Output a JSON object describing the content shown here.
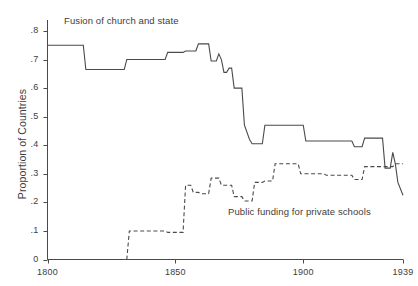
{
  "chart_data": {
    "type": "line",
    "title": "",
    "subtitle": "",
    "xlabel": "",
    "ylabel": "Proportion of Countries",
    "xlim": [
      1800,
      1939
    ],
    "ylim": [
      0,
      0.8
    ],
    "grid": false,
    "legend_position": "inline-annotations",
    "x_ticks": [
      1800,
      1850,
      1900,
      1939
    ],
    "x_tick_labels": [
      "1800",
      "1850",
      "1900",
      "1939"
    ],
    "y_ticks": [
      0,
      0.1,
      0.2,
      0.3,
      0.4,
      0.5,
      0.6,
      0.7,
      0.8
    ],
    "y_tick_labels": [
      "0",
      ".1",
      ".2",
      ".3",
      ".4",
      ".5",
      ".6",
      ".7",
      ".8"
    ],
    "line_color": "#4a4a4a",
    "step_interpolation": "post",
    "series": [
      {
        "name": "Fusion of church and state",
        "style": "solid",
        "annotation": "Fusion of church and state",
        "x": [
          1800,
          1814,
          1815,
          1830,
          1831,
          1846,
          1847,
          1853,
          1854,
          1858,
          1859,
          1863,
          1864,
          1866,
          1867,
          1868,
          1869,
          1870,
          1871,
          1872,
          1873,
          1876,
          1877,
          1879,
          1880,
          1884,
          1885,
          1889,
          1890,
          1900,
          1901,
          1919,
          1920,
          1923,
          1924,
          1931,
          1932,
          1934,
          1935,
          1936,
          1937,
          1939
        ],
        "y": [
          0.75,
          0.75,
          0.665,
          0.665,
          0.7,
          0.7,
          0.725,
          0.725,
          0.73,
          0.73,
          0.755,
          0.755,
          0.695,
          0.695,
          0.72,
          0.7,
          0.655,
          0.655,
          0.67,
          0.67,
          0.6,
          0.6,
          0.47,
          0.42,
          0.405,
          0.405,
          0.47,
          0.47,
          0.47,
          0.47,
          0.415,
          0.415,
          0.395,
          0.395,
          0.425,
          0.425,
          0.32,
          0.32,
          0.375,
          0.335,
          0.27,
          0.225
        ]
      },
      {
        "name": "Public funding for private schools",
        "style": "dashed",
        "annotation": "Public funding for private schools",
        "x": [
          1800,
          1831,
          1832,
          1846,
          1847,
          1853,
          1854,
          1856,
          1857,
          1859,
          1860,
          1863,
          1864,
          1867,
          1868,
          1872,
          1873,
          1876,
          1877,
          1880,
          1881,
          1884,
          1885,
          1888,
          1889,
          1898,
          1899,
          1908,
          1909,
          1919,
          1920,
          1923,
          1924,
          1935,
          1936,
          1939
        ],
        "y": [
          0.0,
          0.0,
          0.1,
          0.1,
          0.095,
          0.095,
          0.26,
          0.26,
          0.235,
          0.235,
          0.23,
          0.23,
          0.285,
          0.285,
          0.26,
          0.26,
          0.22,
          0.22,
          0.205,
          0.205,
          0.27,
          0.27,
          0.275,
          0.275,
          0.335,
          0.335,
          0.3,
          0.3,
          0.295,
          0.295,
          0.28,
          0.28,
          0.325,
          0.325,
          0.335,
          0.335
        ]
      }
    ]
  },
  "axes": {
    "y_title": "Proportion of Countries",
    "y_labels": [
      "0",
      ".1",
      ".2",
      ".3",
      ".4",
      ".5",
      ".6",
      ".7",
      ".8"
    ],
    "x_labels": [
      "1800",
      "1850",
      "1900",
      "1939"
    ]
  },
  "annotations": {
    "fusion": "Fusion of church and state",
    "funding": "Public funding for private schools"
  }
}
